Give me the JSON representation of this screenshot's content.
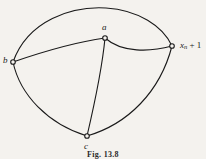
{
  "figure": {
    "caption": "Fig. 13.8",
    "background_color": "#f4f2ee",
    "ink_color": "#1a1a1a",
    "width": 206,
    "height": 159
  },
  "graph": {
    "nodes": [
      {
        "id": "b",
        "label": "b",
        "subscript": "",
        "suffix": "",
        "x": 13,
        "y": 62,
        "marker": "open-circle"
      },
      {
        "id": "a",
        "label": "a",
        "subscript": "",
        "suffix": "",
        "x": 105,
        "y": 38,
        "marker": "open-circle"
      },
      {
        "id": "c",
        "label": "c",
        "subscript": "",
        "suffix": "",
        "x": 87,
        "y": 136,
        "marker": "open-circle"
      },
      {
        "id": "xn1",
        "label": "x",
        "subscript": "n",
        "suffix": "+ 1",
        "x": 172,
        "y": 46,
        "marker": "open-circle"
      }
    ],
    "edges": [
      {
        "id": "b-xn1-top",
        "from": "b",
        "to": "xn1",
        "style": "arc-over-top"
      },
      {
        "id": "b-a",
        "from": "b",
        "to": "a",
        "style": "slight-bow"
      },
      {
        "id": "a-xn1",
        "from": "a",
        "to": "xn1",
        "style": "sag-down"
      },
      {
        "id": "a-c",
        "from": "a",
        "to": "c",
        "style": "near-vertical"
      },
      {
        "id": "b-c",
        "from": "b",
        "to": "c",
        "style": "arc-left-bulge"
      },
      {
        "id": "c-xn1",
        "from": "c",
        "to": "xn1",
        "style": "arc-right-bulge"
      }
    ]
  }
}
